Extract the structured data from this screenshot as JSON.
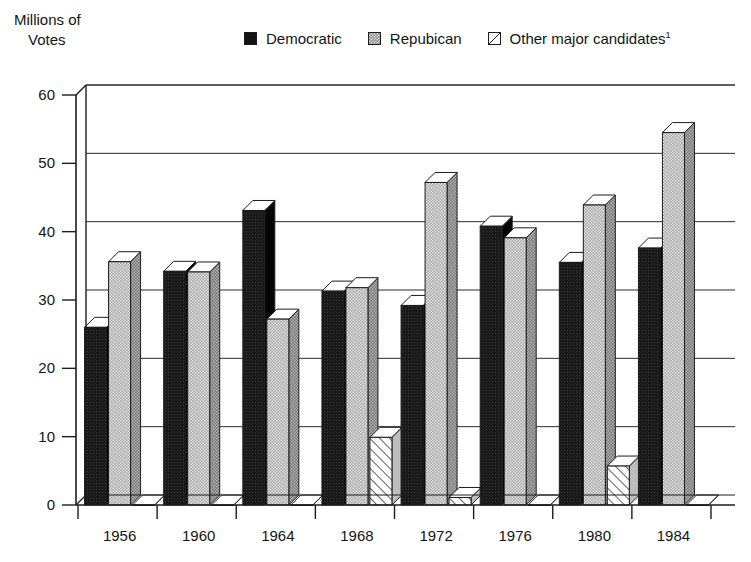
{
  "axis_title": {
    "line1": "Millions of",
    "line2": "Votes"
  },
  "legend": {
    "items": [
      {
        "label": "Democratic",
        "swatch": "solid-black-square-icon",
        "color": "#141414"
      },
      {
        "label": "Repubican",
        "swatch": "gray-checkered-square-icon",
        "color": "#8d8d8d"
      },
      {
        "label": "Other major candidates",
        "superscript": "1",
        "swatch": "diagonal-line-square-icon",
        "color": "#ffffff"
      }
    ]
  },
  "chart_data": {
    "type": "bar",
    "title": "",
    "xlabel": "",
    "ylabel": "Millions of Votes",
    "ylim": [
      0,
      60
    ],
    "yticks": [
      0,
      10,
      20,
      30,
      40,
      50,
      60
    ],
    "grid": true,
    "legend_position": "top",
    "categories": [
      "1956",
      "1960",
      "1964",
      "1968",
      "1972",
      "1976",
      "1980",
      "1984"
    ],
    "series": [
      {
        "name": "Democratic",
        "values": [
          26.0,
          34.2,
          43.1,
          31.3,
          29.2,
          40.8,
          35.5,
          37.6
        ]
      },
      {
        "name": "Repubican",
        "values": [
          35.6,
          34.1,
          27.2,
          31.8,
          47.2,
          39.1,
          43.9,
          54.5
        ]
      },
      {
        "name": "Other major candidates",
        "values": [
          0.0,
          0.0,
          0.0,
          9.9,
          1.1,
          0.0,
          5.7,
          0.0
        ]
      }
    ]
  }
}
